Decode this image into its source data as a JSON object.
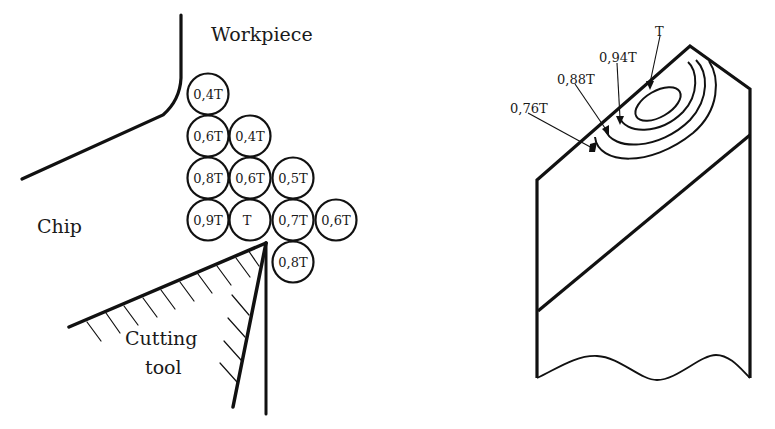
{
  "left_figure": {
    "labels": {
      "workpiece": "Workpiece",
      "chip": "Chip",
      "tool_line1": "Cutting",
      "tool_line2": "tool"
    },
    "temperature_cells": [
      {
        "label": "0,4T",
        "row": 1,
        "col": 1
      },
      {
        "label": "0,6T",
        "row": 2,
        "col": 1
      },
      {
        "label": "0,4T",
        "row": 2,
        "col": 2
      },
      {
        "label": "0,8T",
        "row": 3,
        "col": 1
      },
      {
        "label": "0,6T",
        "row": 3,
        "col": 2
      },
      {
        "label": "0,5T",
        "row": 3,
        "col": 3
      },
      {
        "label": "0,9T",
        "row": 4,
        "col": 1
      },
      {
        "label": "T",
        "row": 4,
        "col": 2
      },
      {
        "label": "0,7T",
        "row": 4,
        "col": 3
      },
      {
        "label": "0,6T",
        "row": 4,
        "col": 4
      },
      {
        "label": "0,8T",
        "row": 5,
        "col": 3
      }
    ]
  },
  "right_figure": {
    "isotherm_labels": [
      "T",
      "0,94T",
      "0,88T",
      "0,76T"
    ]
  }
}
